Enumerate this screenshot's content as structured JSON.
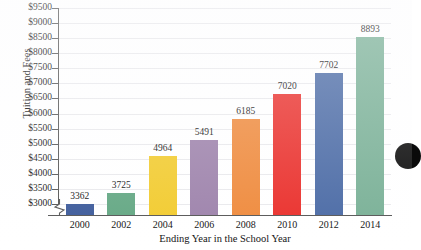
{
  "chart_data": {
    "type": "bar",
    "title": "",
    "xlabel": "Ending Year in the School Year",
    "ylabel": "Tuition and Fees",
    "categories": [
      "2000",
      "2002",
      "2004",
      "2006",
      "2008",
      "2010",
      "2012",
      "2014"
    ],
    "values": [
      3362,
      3725,
      4964,
      5491,
      6185,
      7020,
      7702,
      8893
    ],
    "data_labels": [
      "3362",
      "3725",
      "4964",
      "5491",
      "6185",
      "7020",
      "7702",
      "8893"
    ],
    "bar_colors": [
      "#3c5a9a",
      "#63a783",
      "#f2cb2e",
      "#9d82ab",
      "#ef8a3c",
      "#ea2f2b",
      "#4a6aa5",
      "#79b096"
    ],
    "ylim": [
      3000,
      9500
    ],
    "ytick_labels": [
      "$9500",
      "$9000",
      "$8500",
      "$8000",
      "$7500",
      "$7000",
      "$6500",
      "$6000",
      "$5500",
      "$5000",
      "$4500",
      "$4000",
      "$3500",
      "$3000"
    ],
    "ytick_values": [
      9500,
      9000,
      8500,
      8000,
      7500,
      7000,
      6500,
      6000,
      5500,
      5000,
      4500,
      4000,
      3500,
      3000
    ],
    "ytick_step": 500,
    "grid": true,
    "grid_color": "#e9e9ec",
    "legend": "none",
    "axis_break": true,
    "axis_break_note": "y-axis broken below $3000"
  },
  "annotations": {
    "edge_marker": "black-circle-clipped-right-edge"
  }
}
